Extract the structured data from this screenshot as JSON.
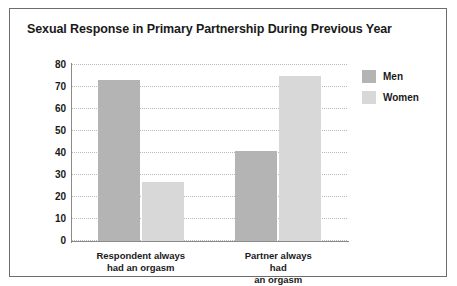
{
  "figure": {
    "title": "Sexual Response in Primary Partnership During Previous Year",
    "border_color": "#6d6d6d",
    "background": "#ffffff"
  },
  "legend": {
    "position": "top-right",
    "entries": [
      {
        "label": "Men",
        "color": "#b4b4b4",
        "swatch_name": "legend-swatch-men"
      },
      {
        "label": "Women",
        "color": "#d8d8d8",
        "swatch_name": "legend-swatch-women"
      }
    ]
  },
  "chart_data": {
    "type": "bar",
    "title": "Sexual Response in Primary Partnership During Previous Year",
    "xlabel": "",
    "ylabel": "",
    "ylim": [
      0,
      80
    ],
    "yticks": [
      0,
      10,
      20,
      30,
      40,
      50,
      60,
      70,
      80
    ],
    "ytick_labels": [
      "0",
      "10",
      "20",
      "30",
      "40",
      "50",
      "60",
      "70",
      "80"
    ],
    "grid": true,
    "grid_style": "dotted",
    "legend_position": "top-right",
    "categories": [
      "Respondent always\nhad an orgasm",
      "Partner always had\nan orgasm"
    ],
    "series": [
      {
        "name": "Men",
        "color": "#b4b4b4",
        "values": [
          73,
          41
        ]
      },
      {
        "name": "Women",
        "color": "#d8d8d8",
        "values": [
          27,
          75
        ]
      }
    ]
  }
}
